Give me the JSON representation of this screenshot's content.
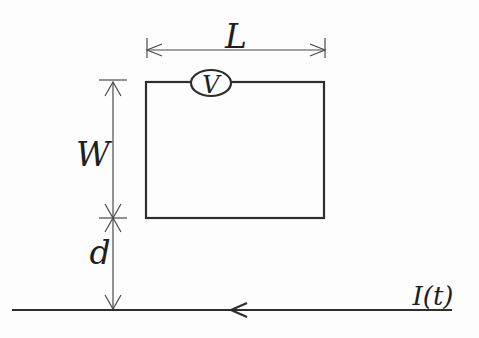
{
  "diagram": {
    "labels": {
      "loop_length": "L",
      "loop_width": "W",
      "distance": "d",
      "voltmeter": "V",
      "current": "I(t)"
    },
    "colors": {
      "background": "#fdfdfd",
      "circuit_line": "#2e2e2e",
      "dimension_line": "#4a4a4a",
      "text": "#1f1f1f"
    }
  }
}
